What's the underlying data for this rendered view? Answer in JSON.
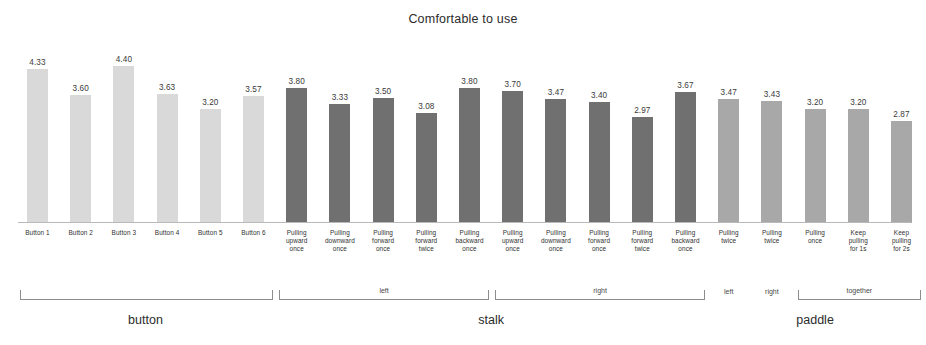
{
  "chart_data": {
    "type": "bar",
    "title": "Comfortable to use",
    "xlabel": "",
    "ylabel": "",
    "ylim": [
      0,
      5
    ],
    "grid": false,
    "legend": "none",
    "categories": [
      "Button 1",
      "Button 2",
      "Button 3",
      "Button 4",
      "Button 5",
      "Button 6",
      "Pulling upward once",
      "Pulling downward once",
      "Pulling forward once",
      "Pulling forward twice",
      "Pulling backward once",
      "Pulling upward once",
      "Pulling downward once",
      "Pulling forward once",
      "Pulling forward twice",
      "Pulling backward once",
      "Pulling twice",
      "Pulling twice",
      "Pulling once",
      "Keep pulling for 1s",
      "Keep pulling for 2s"
    ],
    "values": [
      4.33,
      3.6,
      4.4,
      3.63,
      3.2,
      3.57,
      3.8,
      3.33,
      3.5,
      3.08,
      3.8,
      3.7,
      3.47,
      3.4,
      2.97,
      3.67,
      3.47,
      3.43,
      3.2,
      3.2,
      2.87
    ],
    "bar_labels": [
      "4.33",
      "3.60",
      "4.40",
      "3.63",
      "3.20",
      "3.57",
      "3.80",
      "3.33",
      "3.50",
      "3.08",
      "3.80",
      "3.70",
      "3.47",
      "3.40",
      "2.97",
      "3.67",
      "3.47",
      "3.43",
      "3.20",
      "3.20",
      "2.87"
    ],
    "tick_lines": [
      [
        "Button 1"
      ],
      [
        "Button 2"
      ],
      [
        "Button 3"
      ],
      [
        "Button 4"
      ],
      [
        "Button 5"
      ],
      [
        "Button 6"
      ],
      [
        "Pulling",
        "upward",
        "once"
      ],
      [
        "Pulling",
        "downward",
        "once"
      ],
      [
        "Pulling",
        "forward",
        "once"
      ],
      [
        "Pulling",
        "forward",
        "twice"
      ],
      [
        "Pulling",
        "backward",
        "once"
      ],
      [
        "Pulling",
        "upward",
        "once"
      ],
      [
        "Pulling",
        "downward",
        "once"
      ],
      [
        "Pulling",
        "forward",
        "once"
      ],
      [
        "Pulling",
        "forward",
        "twice"
      ],
      [
        "Pulling",
        "backward",
        "once"
      ],
      [
        "Pulling",
        "twice"
      ],
      [
        "Pulling",
        "twice"
      ],
      [
        "Pulling",
        "once"
      ],
      [
        "Keep",
        "pulling",
        "for 1s"
      ],
      [
        "Keep",
        "pulling",
        "for 2s"
      ]
    ],
    "series": [
      {
        "name": "button",
        "color": "#d9d9d9",
        "bar_indices": [
          0,
          1,
          2,
          3,
          4,
          5
        ]
      },
      {
        "name": "stalk",
        "color": "#707070",
        "bar_indices": [
          6,
          7,
          8,
          9,
          10,
          11,
          12,
          13,
          14,
          15
        ]
      },
      {
        "name": "paddle",
        "color": "#a8a8a8",
        "bar_indices": [
          16,
          17,
          18,
          19,
          20
        ]
      }
    ],
    "subgroups": [
      {
        "label": "",
        "bracket": true,
        "first": 0,
        "last": 5
      },
      {
        "label": "left",
        "bracket": true,
        "first": 6,
        "last": 10
      },
      {
        "label": "right",
        "bracket": true,
        "first": 11,
        "last": 15
      },
      {
        "label": "left",
        "bracket": false,
        "first": 16,
        "last": 16
      },
      {
        "label": "right",
        "bracket": false,
        "first": 17,
        "last": 17
      },
      {
        "label": "together",
        "bracket": true,
        "first": 18,
        "last": 20
      }
    ],
    "groups": [
      {
        "label": "button",
        "first": 0,
        "last": 5
      },
      {
        "label": "stalk",
        "first": 6,
        "last": 15
      },
      {
        "label": "paddle",
        "first": 16,
        "last": 20
      }
    ]
  },
  "colors": {
    "button": "#d9d9d9",
    "stalk": "#707070",
    "paddle": "#a8a8a8",
    "axis": "#b9b9b9",
    "text": "#2b2b2b"
  }
}
